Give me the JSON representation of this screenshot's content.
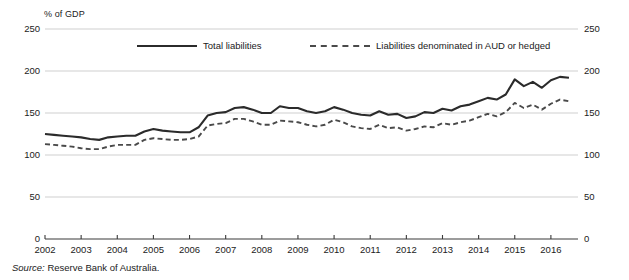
{
  "axis_unit_label": "% of GDP",
  "source": {
    "label": "Source:",
    "text": "Reserve Bank of Australia."
  },
  "legend": {
    "position": "top-inside",
    "entries": [
      {
        "label": "Total liabilities",
        "style": "solid",
        "color": "#2b2b2b"
      },
      {
        "label": "Liabilities denominated in AUD or hedged",
        "style": "dashed",
        "color": "#4a4a4a"
      }
    ]
  },
  "chart_data": {
    "type": "line",
    "title": "",
    "subtitle": "",
    "xlabel": "",
    "ylabel": "% of GDP",
    "ylim": [
      0,
      250
    ],
    "xlim": [
      2002,
      2016.75
    ],
    "yticks": [
      0,
      50,
      100,
      150,
      200,
      250
    ],
    "ytick_labels_left": [
      "0",
      "50",
      "100",
      "150",
      "200",
      "250"
    ],
    "ytick_labels_right": [
      "0",
      "50",
      "100",
      "150",
      "200",
      "250"
    ],
    "xticks": [
      2002,
      2003,
      2004,
      2005,
      2006,
      2007,
      2008,
      2009,
      2010,
      2011,
      2012,
      2013,
      2014,
      2015,
      2016
    ],
    "xtick_labels": [
      "2002",
      "2003",
      "2004",
      "2005",
      "2006",
      "2007",
      "2008",
      "2009",
      "2010",
      "2011",
      "2012",
      "2013",
      "2014",
      "2015",
      "2016"
    ],
    "grid": "horizontal",
    "frequency": "quarterly",
    "x": [
      2002.0,
      2002.25,
      2002.5,
      2002.75,
      2003.0,
      2003.25,
      2003.5,
      2003.75,
      2004.0,
      2004.25,
      2004.5,
      2004.75,
      2005.0,
      2005.25,
      2005.5,
      2005.75,
      2006.0,
      2006.25,
      2006.5,
      2006.75,
      2007.0,
      2007.25,
      2007.5,
      2007.75,
      2008.0,
      2008.25,
      2008.5,
      2008.75,
      2009.0,
      2009.25,
      2009.5,
      2009.75,
      2010.0,
      2010.25,
      2010.5,
      2010.75,
      2011.0,
      2011.25,
      2011.5,
      2011.75,
      2012.0,
      2012.25,
      2012.5,
      2012.75,
      2013.0,
      2013.25,
      2013.5,
      2013.75,
      2014.0,
      2014.25,
      2014.5,
      2014.75,
      2015.0,
      2015.25,
      2015.5,
      2015.75,
      2016.0,
      2016.25,
      2016.5
    ],
    "series": [
      {
        "name": "Total liabilities",
        "style": "solid",
        "color": "#2b2b2b",
        "values": [
          125,
          124,
          123,
          122,
          121,
          119,
          118,
          121,
          122,
          123,
          123,
          128,
          131,
          129,
          128,
          127,
          127,
          133,
          147,
          150,
          151,
          156,
          157,
          154,
          150,
          150,
          158,
          156,
          156,
          152,
          150,
          152,
          157,
          154,
          150,
          148,
          147,
          152,
          148,
          149,
          144,
          146,
          151,
          150,
          155,
          153,
          158,
          160,
          164,
          168,
          166,
          172,
          190,
          182,
          187,
          180,
          189,
          193,
          192
        ]
      },
      {
        "name": "Liabilities denominated in AUD or hedged",
        "style": "dashed",
        "color": "#4a4a4a",
        "values": [
          113,
          112,
          111,
          110,
          108,
          107,
          107,
          110,
          112,
          112,
          112,
          118,
          120,
          119,
          118,
          118,
          119,
          122,
          135,
          137,
          138,
          143,
          143,
          140,
          136,
          136,
          141,
          140,
          139,
          136,
          134,
          136,
          142,
          139,
          134,
          132,
          131,
          136,
          132,
          133,
          129,
          131,
          134,
          133,
          138,
          136,
          139,
          141,
          145,
          149,
          146,
          151,
          162,
          156,
          160,
          154,
          161,
          166,
          164
        ]
      }
    ]
  },
  "plot_geometry": {
    "left": 45,
    "right": 578,
    "top": 29,
    "bottom": 239
  }
}
